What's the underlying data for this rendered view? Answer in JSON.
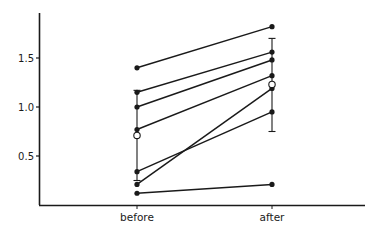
{
  "chart_data": {
    "type": "line",
    "title": "",
    "xlabel": "",
    "ylabel": "",
    "categories": [
      "before",
      "after"
    ],
    "yticks": [
      {
        "value": 0.5,
        "label": "0.5"
      },
      {
        "value": 1.0,
        "label": "1.0"
      },
      {
        "value": 1.5,
        "label": "1.5"
      }
    ],
    "ylim": [
      0,
      1.97
    ],
    "grid": false,
    "legend": null,
    "series": [
      {
        "name": "subject-1",
        "values": [
          1.4,
          1.82
        ]
      },
      {
        "name": "subject-2",
        "values": [
          1.15,
          1.56
        ]
      },
      {
        "name": "subject-3",
        "values": [
          1.0,
          1.48
        ]
      },
      {
        "name": "subject-4",
        "values": [
          0.77,
          1.32
        ]
      },
      {
        "name": "subject-5",
        "values": [
          0.34,
          0.95
        ]
      },
      {
        "name": "subject-6",
        "values": [
          0.21,
          1.19
        ]
      },
      {
        "name": "subject-7",
        "values": [
          0.12,
          0.21
        ]
      }
    ],
    "summary": [
      {
        "category": "before",
        "mean": 0.71,
        "err_low": 0.25,
        "err_high": 1.17,
        "marker": "open-circle"
      },
      {
        "category": "after",
        "mean": 1.23,
        "err_low": 0.75,
        "err_high": 1.7,
        "marker": "open-circle"
      }
    ],
    "colors": {
      "ink": "#1a1a1a",
      "background": "#ffffff"
    }
  }
}
